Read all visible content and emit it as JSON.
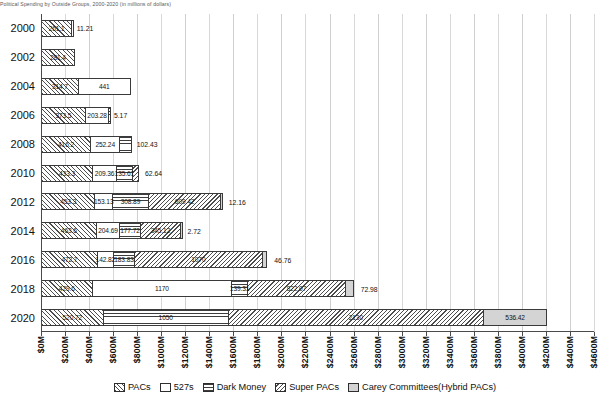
{
  "title_strip": "Political Spending by Outside Groups, 2000-2020 (in millions of dollars)",
  "chart_data": {
    "type": "bar",
    "orientation": "horizontal",
    "stacked": true,
    "title": "Political Spending by Outside Groups, 2000-2020 (in millions of dollars)",
    "xlabel": "",
    "ylabel": "",
    "xlim": [
      0,
      4600
    ],
    "grid": true,
    "legend_position": "bottom",
    "categories": [
      "2000",
      "2002",
      "2004",
      "2006",
      "2008",
      "2010",
      "2012",
      "2014",
      "2016",
      "2018",
      "2020"
    ],
    "series": [
      {
        "name": "PACs",
        "key": "pacs",
        "values": [
          261.1,
          281.4,
          314.7,
          373.5,
          416.2,
          433.3,
          453.3,
          463.6,
          472.7,
          429.6,
          520.72
        ]
      },
      {
        "name": "527s",
        "key": "527s",
        "values": [
          11.21,
          null,
          441,
          203.28,
          252.24,
          209.36,
          153.13,
          204.69,
          142.82,
          1170,
          null
        ]
      },
      {
        "name": "Dark Money",
        "key": "dark",
        "values": [
          null,
          null,
          null,
          5.17,
          102.43,
          135.61,
          308.89,
          177.72,
          183.83,
          139.31,
          1050
        ]
      },
      {
        "name": "Super PACs",
        "key": "super",
        "values": [
          null,
          null,
          null,
          null,
          null,
          62.64,
          609.42,
          345.12,
          1070,
          822.07,
          2130
        ]
      },
      {
        "name": "Carey Committees(Hybrid PACs)",
        "key": "carey",
        "values": [
          null,
          null,
          null,
          null,
          null,
          null,
          12.16,
          2.72,
          46.76,
          72.98,
          536.42
        ]
      }
    ],
    "xticks": [
      "$0M",
      "$200M",
      "$400M",
      "$600M",
      "$800M",
      "$1000M",
      "$1200M",
      "$1400M",
      "$1600M",
      "$1800M",
      "$2000M",
      "$2200M",
      "$2400M",
      "$2600M",
      "$2800M",
      "$3000M",
      "$3200M",
      "$3400M",
      "$3600M",
      "$3800M",
      "$4000M",
      "$4200M",
      "$4400M",
      "$4600M"
    ],
    "xtick_values": [
      0,
      200,
      400,
      600,
      800,
      1000,
      1200,
      1400,
      1600,
      1800,
      2000,
      2200,
      2400,
      2600,
      2800,
      3000,
      3200,
      3400,
      3600,
      3800,
      4000,
      4200,
      4400,
      4600
    ],
    "rows": [
      {
        "year": "2000",
        "segments": [
          {
            "key": "pacs",
            "label": "261.1",
            "value": 261.1,
            "inside": true
          },
          {
            "key": "527s",
            "label": "11.21",
            "value": 11.21,
            "inside": false
          }
        ]
      },
      {
        "year": "2002",
        "segments": [
          {
            "key": "pacs",
            "label": "281.4",
            "value": 281.4,
            "inside": true
          }
        ]
      },
      {
        "year": "2004",
        "segments": [
          {
            "key": "pacs",
            "label": "314.7",
            "value": 314.7,
            "inside": true
          },
          {
            "key": "527s",
            "label": "441",
            "value": 441,
            "inside": true
          }
        ]
      },
      {
        "year": "2006",
        "segments": [
          {
            "key": "pacs",
            "label": "373.5",
            "value": 373.5,
            "inside": true
          },
          {
            "key": "527s",
            "label": "203.28",
            "value": 203.28,
            "inside": true
          },
          {
            "key": "dark",
            "label": "5.17",
            "value": 5.17,
            "inside": false
          }
        ]
      },
      {
        "year": "2008",
        "segments": [
          {
            "key": "pacs",
            "label": "416.2",
            "value": 416.2,
            "inside": true
          },
          {
            "key": "527s",
            "label": "252.24",
            "value": 252.24,
            "inside": true
          },
          {
            "key": "dark",
            "label": "102.43",
            "value": 102.43,
            "inside": false
          }
        ]
      },
      {
        "year": "2010",
        "segments": [
          {
            "key": "pacs",
            "label": "433.3",
            "value": 433.3,
            "inside": true
          },
          {
            "key": "527s",
            "label": "209.36",
            "value": 209.36,
            "inside": true
          },
          {
            "key": "dark",
            "label": "135.61",
            "value": 135.61,
            "inside": true
          },
          {
            "key": "super",
            "label": "62.64",
            "value": 62.64,
            "inside": false
          }
        ]
      },
      {
        "year": "2012",
        "segments": [
          {
            "key": "pacs",
            "label": "453.3",
            "value": 453.3,
            "inside": true
          },
          {
            "key": "527s",
            "label": "153.13",
            "value": 153.13,
            "inside": true
          },
          {
            "key": "dark",
            "label": "308.89",
            "value": 308.89,
            "inside": true
          },
          {
            "key": "super",
            "label": "609.42",
            "value": 609.42,
            "inside": true
          },
          {
            "key": "carey",
            "label": "12.16",
            "value": 12.16,
            "inside": false
          }
        ]
      },
      {
        "year": "2014",
        "segments": [
          {
            "key": "pacs",
            "label": "463.6",
            "value": 463.6,
            "inside": true
          },
          {
            "key": "527s",
            "label": "204.69",
            "value": 204.69,
            "inside": true
          },
          {
            "key": "dark",
            "label": "177.72",
            "value": 177.72,
            "inside": true
          },
          {
            "key": "super",
            "label": "345.12",
            "value": 345.12,
            "inside": true
          },
          {
            "key": "carey",
            "label": "2.72",
            "value": 2.72,
            "inside": false
          }
        ]
      },
      {
        "year": "2016",
        "segments": [
          {
            "key": "pacs",
            "label": "472.7",
            "value": 472.7,
            "inside": true
          },
          {
            "key": "527s",
            "label": "142.82",
            "value": 142.82,
            "inside": true
          },
          {
            "key": "dark",
            "label": "183.83",
            "value": 183.83,
            "inside": true
          },
          {
            "key": "super",
            "label": "1070",
            "value": 1070,
            "inside": true
          },
          {
            "key": "carey",
            "label": "46.76",
            "value": 46.76,
            "inside": false
          }
        ]
      },
      {
        "year": "2018",
        "segments": [
          {
            "key": "pacs",
            "label": "429.6",
            "value": 429.6,
            "inside": true
          },
          {
            "key": "527s",
            "label": "1170",
            "value": 1170,
            "inside": true
          },
          {
            "key": "dark",
            "label": "139.31",
            "value": 139.31,
            "inside": true
          },
          {
            "key": "super",
            "label": "822.07",
            "value": 822.07,
            "inside": true
          },
          {
            "key": "carey",
            "label": "72.98",
            "value": 72.98,
            "inside": false
          }
        ]
      },
      {
        "year": "2020",
        "segments": [
          {
            "key": "pacs",
            "label": "520.72",
            "value": 520.72,
            "inside": true
          },
          {
            "key": "dark",
            "label": "1050",
            "value": 1050,
            "inside": true
          },
          {
            "key": "super",
            "label": "2130",
            "value": 2130,
            "inside": true
          },
          {
            "key": "carey",
            "label": "536.42",
            "value": 536.42,
            "inside": true
          }
        ]
      }
    ]
  },
  "legend": [
    {
      "label": "PACs",
      "key": "pacs"
    },
    {
      "label": "527s",
      "key": "527s"
    },
    {
      "label": "Dark Money",
      "key": "dark"
    },
    {
      "label": "Super PACs",
      "key": "super"
    },
    {
      "label": "Carey Committees(Hybrid PACs)",
      "key": "carey"
    }
  ]
}
